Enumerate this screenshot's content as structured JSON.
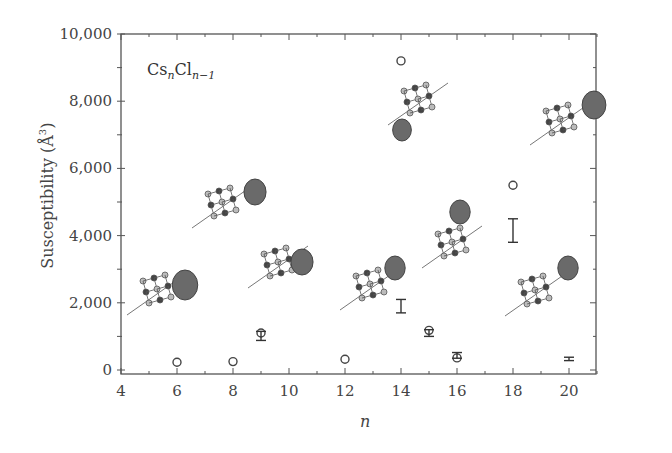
{
  "chart_data": {
    "type": "scatter",
    "title": "",
    "annotation": "CsnCln-1",
    "annotation_parts": {
      "base1": "Cs",
      "sub1": "n",
      "base2": "Cl",
      "sub2": "n−1"
    },
    "xlabel": "n",
    "ylabel": "Susceptibility (Å3)",
    "ylabel_parts": {
      "text": "Susceptibility (",
      "unit": "Å",
      "sup": "3",
      "close": ")"
    },
    "xlim": [
      4,
      21
    ],
    "ylim": [
      0,
      10000
    ],
    "xticks": [
      4,
      6,
      8,
      10,
      12,
      14,
      16,
      18,
      20
    ],
    "xtick_labels": [
      "4",
      "6",
      "8",
      "10",
      "12",
      "14",
      "16",
      "18",
      "20"
    ],
    "yticks": [
      0,
      2000,
      4000,
      6000,
      8000,
      10000
    ],
    "ytick_labels": [
      "0",
      "2,000",
      "4,000",
      "6,000",
      "8,000",
      "10,000"
    ],
    "grid": false,
    "legend": null,
    "series": [
      {
        "name": "Computed susceptibility (circles)",
        "marker": "open-circle",
        "x": [
          6,
          8,
          9,
          12,
          14,
          15,
          16,
          18,
          20
        ],
        "values": [
          230,
          250,
          1100,
          320,
          9200,
          1180,
          360,
          5500,
          null
        ]
      },
      {
        "name": "Experimental range (error bars)",
        "marker": "errorbar",
        "points": [
          {
            "x": 9,
            "low": 880,
            "high": 1150
          },
          {
            "x": 14,
            "low": 1700,
            "high": 2100
          },
          {
            "x": 15,
            "low": 1000,
            "high": 1200
          },
          {
            "x": 16,
            "low": 350,
            "high": 520
          },
          {
            "x": 18,
            "low": 3800,
            "high": 4500
          },
          {
            "x": 20,
            "low": 280,
            "high": 380
          }
        ]
      }
    ],
    "insets": [
      {
        "desc": "cluster structure with dark lobe",
        "near_n": 6
      },
      {
        "desc": "cluster structure with dark lobe",
        "near_n": 8
      },
      {
        "desc": "cluster structure with dark lobe",
        "near_n": 10
      },
      {
        "desc": "cluster structure with lobe",
        "near_n": 12
      },
      {
        "desc": "cluster structure with dark lobe",
        "near_n": 14
      },
      {
        "desc": "cluster structure with lobe",
        "near_n": 15
      },
      {
        "desc": "cluster structure with lobe",
        "near_n": 17
      },
      {
        "desc": "cluster structure with lobe",
        "near_n": 18
      }
    ]
  }
}
